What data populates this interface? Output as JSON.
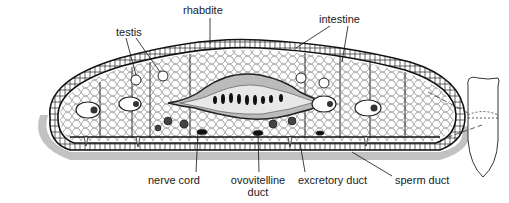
{
  "diagram": {
    "labels": {
      "rhabdite": "rhabdite",
      "testis": "testis",
      "intestine": "intestine",
      "nerve_cord": "nerve cord",
      "ovovitelline_duct_line1": "ovovitelline",
      "ovovitelline_duct_line2": "duct",
      "excretory_duct": "excretory duct",
      "sperm_duct": "sperm duct"
    },
    "inset": {
      "description": "whole-body outline with section plane marked by dashed lines"
    },
    "colors": {
      "ink": "#1a1a1a",
      "background": "#ffffff"
    }
  }
}
